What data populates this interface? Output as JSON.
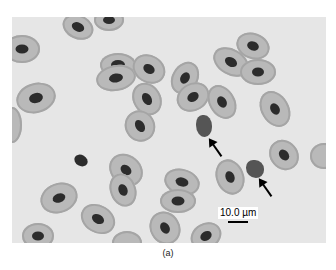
{
  "figure": {
    "scale_label": "10.0 µm",
    "caption": "(a)",
    "background_color": "#e6e6e6",
    "cell_color": "#b9b9b9",
    "nucleus_color": "#2c2c2c"
  }
}
